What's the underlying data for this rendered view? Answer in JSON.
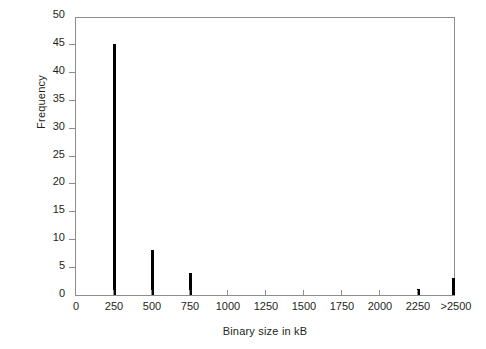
{
  "chart_data": {
    "type": "bar",
    "title": "",
    "subtitle": "",
    "xlabel": "Binary size in kB",
    "ylabel": "Frequency",
    "categories": [
      "250",
      "500",
      "750",
      "2250",
      ">2500"
    ],
    "values": [
      45,
      8,
      4,
      1,
      3
    ],
    "series": [
      {
        "name": "Frequency",
        "values": [
          45,
          8,
          4,
          1,
          3
        ]
      }
    ],
    "bars": [
      {
        "category": "250",
        "x": 250,
        "value": 45
      },
      {
        "category": "500",
        "x": 500,
        "value": 8
      },
      {
        "category": "750",
        "x": 750,
        "value": 4
      },
      {
        "category": "2250",
        "x": 2250,
        "value": 1
      },
      {
        "category": ">2500",
        "x": 2500,
        "value": 3
      }
    ],
    "xticklabels": [
      "0",
      "250",
      "500",
      "750",
      "1000",
      "1250",
      "1500",
      "1750",
      "2000",
      "2250",
      ">2500"
    ],
    "xtickvalues": [
      0,
      250,
      500,
      750,
      1000,
      1250,
      1500,
      1750,
      2000,
      2250,
      2500
    ],
    "yticklabels": [
      "0",
      "5",
      "10",
      "15",
      "20",
      "25",
      "30",
      "35",
      "40",
      "45",
      "50"
    ],
    "ytickvalues": [
      0,
      5,
      10,
      15,
      20,
      25,
      30,
      35,
      40,
      45,
      50
    ],
    "xlim": [
      0,
      2500
    ],
    "ylim": [
      0,
      50
    ],
    "grid": false,
    "legend": null,
    "legend_position": "none",
    "annotations": [],
    "colors": {
      "bar": "#000000",
      "axis": "#8d8d8d",
      "text": "#231f20",
      "background": "#ffffff"
    }
  }
}
